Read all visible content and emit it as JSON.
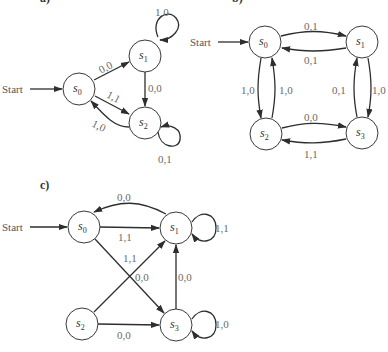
{
  "diagrams": [
    {
      "panel_label": "a)",
      "start_label": "Start",
      "start_state": "s0",
      "states": [
        {
          "id": "s0",
          "name": "s",
          "sub": "0"
        },
        {
          "id": "s1",
          "name": "s",
          "sub": "1"
        },
        {
          "id": "s2",
          "name": "s",
          "sub": "2"
        }
      ],
      "transitions": [
        {
          "from": "s0",
          "to": "s1",
          "label": "0,0"
        },
        {
          "from": "s0",
          "to": "s2",
          "label": "1,1"
        },
        {
          "from": "s1",
          "to": "s1",
          "label": "1,0"
        },
        {
          "from": "s1",
          "to": "s2",
          "label": "0,0"
        },
        {
          "from": "s2",
          "to": "s0",
          "label": "1,0"
        },
        {
          "from": "s2",
          "to": "s2",
          "label": "0,1"
        }
      ]
    },
    {
      "panel_label": "b)",
      "start_label": "Start",
      "start_state": "s0",
      "states": [
        {
          "id": "s0",
          "name": "s",
          "sub": "0"
        },
        {
          "id": "s1",
          "name": "s",
          "sub": "1"
        },
        {
          "id": "s2",
          "name": "s",
          "sub": "2"
        },
        {
          "id": "s3",
          "name": "s",
          "sub": "3"
        }
      ],
      "transitions": [
        {
          "from": "s0",
          "to": "s1",
          "label": "0,1"
        },
        {
          "from": "s1",
          "to": "s0",
          "label": "0,1"
        },
        {
          "from": "s0",
          "to": "s2",
          "label": "1,0"
        },
        {
          "from": "s2",
          "to": "s0",
          "label": "1,0"
        },
        {
          "from": "s3",
          "to": "s1",
          "label": "0,1"
        },
        {
          "from": "s1",
          "to": "s3",
          "label": "1,0"
        },
        {
          "from": "s2",
          "to": "s3",
          "label": "0,0"
        },
        {
          "from": "s3",
          "to": "s2",
          "label": "1,1"
        }
      ]
    },
    {
      "panel_label": "c)",
      "start_label": "Start",
      "start_state": "s0",
      "states": [
        {
          "id": "s0",
          "name": "s",
          "sub": "0"
        },
        {
          "id": "s1",
          "name": "s",
          "sub": "1"
        },
        {
          "id": "s2",
          "name": "s",
          "sub": "2"
        },
        {
          "id": "s3",
          "name": "s",
          "sub": "3"
        }
      ],
      "transitions": [
        {
          "from": "s1",
          "to": "s0",
          "label": "0,0"
        },
        {
          "from": "s0",
          "to": "s1",
          "label": "1,1"
        },
        {
          "from": "s1",
          "to": "s1",
          "label": "1,1"
        },
        {
          "from": "s2",
          "to": "s1",
          "label": "1,1"
        },
        {
          "from": "s0",
          "to": "s3",
          "label": "0,0"
        },
        {
          "from": "s3",
          "to": "s1",
          "label": "0,0"
        },
        {
          "from": "s2",
          "to": "s3",
          "label": "0,0"
        },
        {
          "from": "s3",
          "to": "s3",
          "label": "1,0"
        }
      ]
    }
  ]
}
